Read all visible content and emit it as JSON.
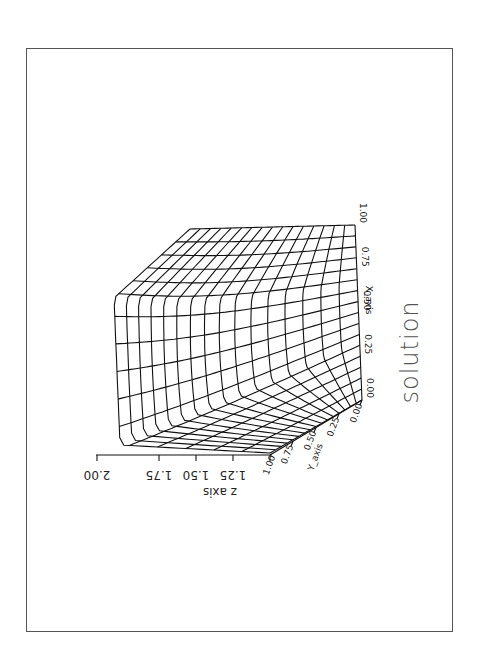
{
  "chart_data": {
    "type": "surface3d",
    "title": "solution",
    "orientation": "rotated 90 degrees (page in landscape)",
    "xlabel": "X_axis",
    "ylabel": "Y_axis",
    "zlabel": "z axis",
    "x_ticks": [
      "0.00",
      "0.25",
      "0.50",
      "0.75",
      "1.00"
    ],
    "y_ticks": [
      "0.00",
      "0.25",
      "0.50",
      "0.75",
      "1.00"
    ],
    "z_ticks": [
      "1.00",
      "1.25",
      "1.50",
      "1.75",
      "2.00"
    ],
    "xlim": [
      0,
      1
    ],
    "ylim": [
      0,
      1
    ],
    "zlim": [
      1,
      2
    ],
    "grid_lines_per_direction": 17,
    "style": "black wireframe mesh"
  },
  "labels": {
    "title": "solution",
    "x_axis": "X_axis",
    "y_axis": "Y_axis",
    "z_axis": "z axis"
  },
  "colors": {
    "mesh": "#111111",
    "frame": "#555555",
    "title": "#555555",
    "background": "#ffffff"
  }
}
